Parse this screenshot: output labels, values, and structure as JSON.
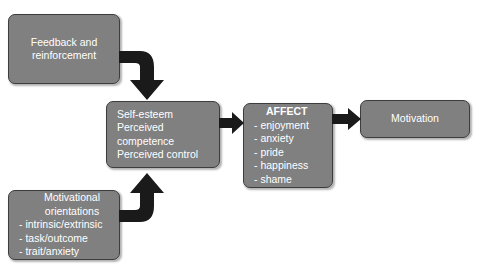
{
  "diagram": {
    "background_color": "#ffffff",
    "box_fill_color": "#808080",
    "box_border_color": "#3d3d3d",
    "box_text_color": "#ffffff",
    "arrow_color": "#1a1a1a",
    "boxes": {
      "feedback": {
        "lines": [
          "Feedback and",
          "reinforcement"
        ],
        "line1": "Feedback and",
        "line2": "reinforcement"
      },
      "motivational": {
        "heading_line1": "Motivational",
        "heading_line2": "orientations",
        "items": [
          "-  intrinsic/extrinsic",
          "-  task/outcome",
          "-  trait/anxiety"
        ],
        "item1": "-  intrinsic/extrinsic",
        "item2": "-  task/outcome",
        "item3": "-  trait/anxiety"
      },
      "selfesteem": {
        "lines": [
          "Self-esteem",
          "Perceived",
          "competence",
          "Perceived control"
        ],
        "line1": "Self-esteem",
        "line2": "Perceived",
        "line3": "competence",
        "line4": "Perceived control"
      },
      "affect": {
        "heading": "AFFECT",
        "items": [
          "- enjoyment",
          "- anxiety",
          "- pride",
          "- happiness",
          "- shame"
        ],
        "item1": "- enjoyment",
        "item2": "- anxiety",
        "item3": "- pride",
        "item4": "- happiness",
        "item5": "- shame"
      },
      "motivation": {
        "label": "Motivation"
      }
    },
    "arrows": [
      {
        "name": "feedback-to-selfesteem",
        "type": "elbow-right-down"
      },
      {
        "name": "motivational-to-selfesteem",
        "type": "elbow-right-up"
      },
      {
        "name": "selfesteem-to-affect",
        "type": "straight-right"
      },
      {
        "name": "affect-to-motivation",
        "type": "straight-right"
      }
    ]
  }
}
